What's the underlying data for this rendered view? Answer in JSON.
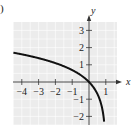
{
  "panel_label": ")",
  "chart_data": {
    "type": "line",
    "title": "",
    "xlabel": "x",
    "ylabel": "y",
    "xlim": [
      -4.5,
      1.7
    ],
    "ylim": [
      -2.6,
      3.5
    ],
    "grid": true,
    "x_ticks": [
      -4,
      -3,
      -2,
      -1,
      1
    ],
    "x_tick_labels": [
      "-4",
      "-3",
      "-2",
      "-1",
      "1"
    ],
    "y_ticks": [
      3,
      2,
      1,
      -1,
      -2
    ],
    "y_tick_labels": [
      "3",
      "2",
      "1",
      "-1",
      "-2"
    ],
    "series": [
      {
        "name": "f(x)",
        "x": [
          -4.5,
          -4,
          -3,
          -2,
          -1,
          -0.5,
          0,
          0.5,
          0.8,
          0.9,
          0.93
        ],
        "y": [
          1.7,
          1.61,
          1.39,
          1.1,
          0.69,
          0.41,
          0,
          -0.69,
          -1.61,
          -2.3,
          -2.6
        ]
      }
    ],
    "colors": {
      "background": "#ececec",
      "grid": "#ffffff",
      "curve": "#111111",
      "axis": "#333333"
    }
  }
}
